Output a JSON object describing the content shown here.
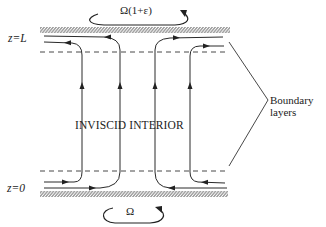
{
  "diagram": {
    "type": "ekman-boundary-layer-flow",
    "labels": {
      "top_rotation": "Ω(1+ε)",
      "bottom_rotation": "Ω",
      "z_top": "z=L",
      "z_bottom": "z=0",
      "interior": "INVISCID INTERIOR",
      "boundary_line1": "Boundary",
      "boundary_line2": "layers"
    },
    "plates": [
      {
        "name": "top-plate",
        "x1": 40,
        "x2": 230,
        "y": 27,
        "height": 6
      },
      {
        "name": "bottom-plate",
        "x1": 40,
        "x2": 228,
        "y": 191,
        "height": 6
      }
    ],
    "dashed_lines": [
      {
        "name": "top-boundary-layer-edge",
        "y": 52,
        "x1": 40,
        "x2": 228
      },
      {
        "name": "bottom-boundary-layer-edge",
        "y": 171,
        "x1": 40,
        "x2": 228
      }
    ],
    "streamline_x": [
      82,
      120,
      155,
      190
    ],
    "colors": {
      "ink": "#2a2a2a",
      "background": "#ffffff"
    }
  }
}
